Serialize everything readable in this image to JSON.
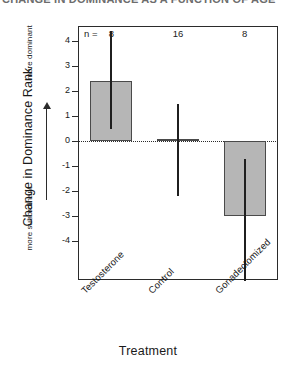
{
  "figure": {
    "top_clipped_title": "CHANGE IN DOMINANCE AS A FUNCTION OF AGE",
    "bottom_clipped_caption": "",
    "background_color": "#ffffff",
    "bar_fill_color": "#b6b6b6",
    "bar_edge_color": "#4a4a4a",
    "axis_color": "#2b2b2b",
    "errorbar_color": "#1f1f1f"
  },
  "axes": {
    "y_axis_title": "Change in Dominance Rank",
    "y_direction_top": "more dominant",
    "y_direction_bottom": "more subordinant",
    "x_axis_title": "Treatment",
    "n_label": "n ="
  },
  "chart_data": {
    "type": "bar",
    "title": "CHANGE IN DOMINANCE AS A FUNCTION OF AGE",
    "xlabel": "Treatment",
    "ylabel": "Change in Dominance Rank",
    "categories": [
      "Testosterone",
      "Control",
      "Gonadectomized"
    ],
    "values": [
      2.4,
      0.1,
      -3.0
    ],
    "error_low": [
      0.5,
      -2.2,
      -5.6
    ],
    "error_high": [
      4.4,
      1.5,
      -0.7
    ],
    "sample_sizes": [
      8,
      16,
      8
    ],
    "ylim": [
      -4.6,
      4.6
    ],
    "yticks": [
      4,
      3,
      2,
      1,
      0,
      -1,
      -2,
      -3,
      -4
    ],
    "ytick_labels": [
      "4",
      "3",
      "2",
      "1",
      "0",
      "-1",
      "-2",
      "-3",
      "-4"
    ],
    "grid": false,
    "legend": "none",
    "zero_reference_line": true,
    "annotations": [
      {
        "text": "n =",
        "value": null
      },
      {
        "text": "8",
        "value": 8
      },
      {
        "text": "16",
        "value": 16
      },
      {
        "text": "8",
        "value": 8
      }
    ]
  }
}
